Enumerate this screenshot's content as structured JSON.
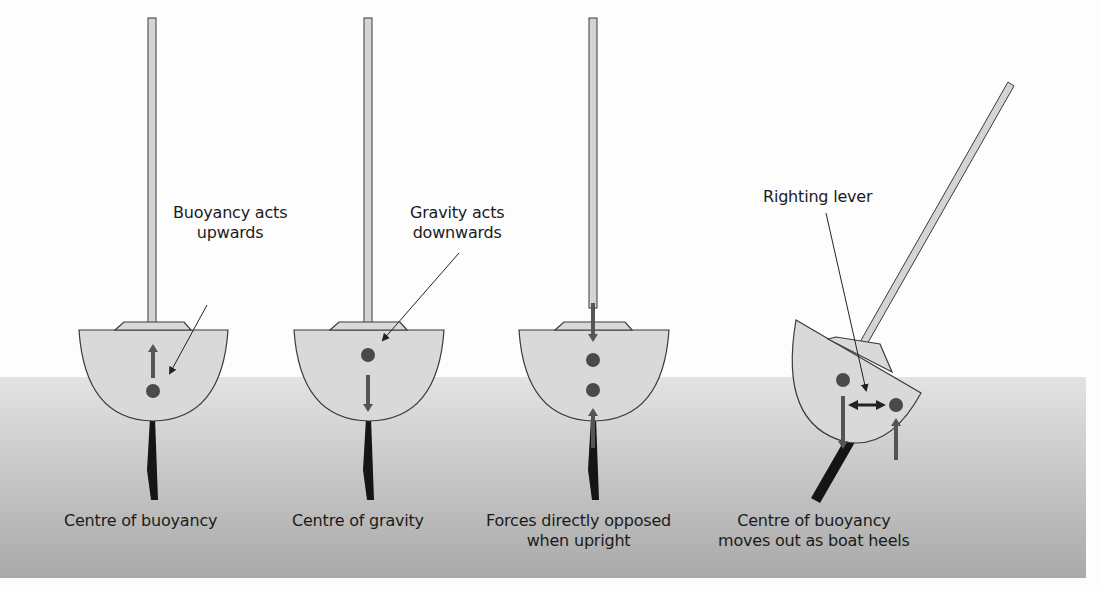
{
  "diagram": {
    "topic": "Boat stability: buoyancy and gravity",
    "panels": [
      {
        "id": "buoyancy",
        "annotation": [
          "Buoyancy acts",
          "upwards"
        ],
        "caption": [
          "Centre of buoyancy"
        ],
        "arrows": [
          "up"
        ]
      },
      {
        "id": "gravity",
        "annotation": [
          "Gravity acts",
          "downwards"
        ],
        "caption": [
          "Centre of gravity"
        ],
        "arrows": [
          "down"
        ]
      },
      {
        "id": "opposed",
        "annotation": [],
        "caption": [
          "Forces directly opposed",
          "when upright"
        ],
        "arrows": [
          "down",
          "up"
        ]
      },
      {
        "id": "heeled",
        "annotation": [
          "Righting lever"
        ],
        "caption": [
          "Centre of buoyancy",
          "moves out as boat heels"
        ],
        "arrows": [
          "down",
          "up",
          "double-horizontal"
        ]
      }
    ],
    "colors": {
      "hull_fill": "#d9d9d9",
      "outline": "#3a3a3a",
      "arrow": "#555555",
      "centre_dot": "#4a4a4a",
      "keel": "#151515",
      "water_top": "#e3e3e3",
      "water_bottom": "#a9a9a9",
      "mast_fill": "#d4d4d4"
    }
  }
}
